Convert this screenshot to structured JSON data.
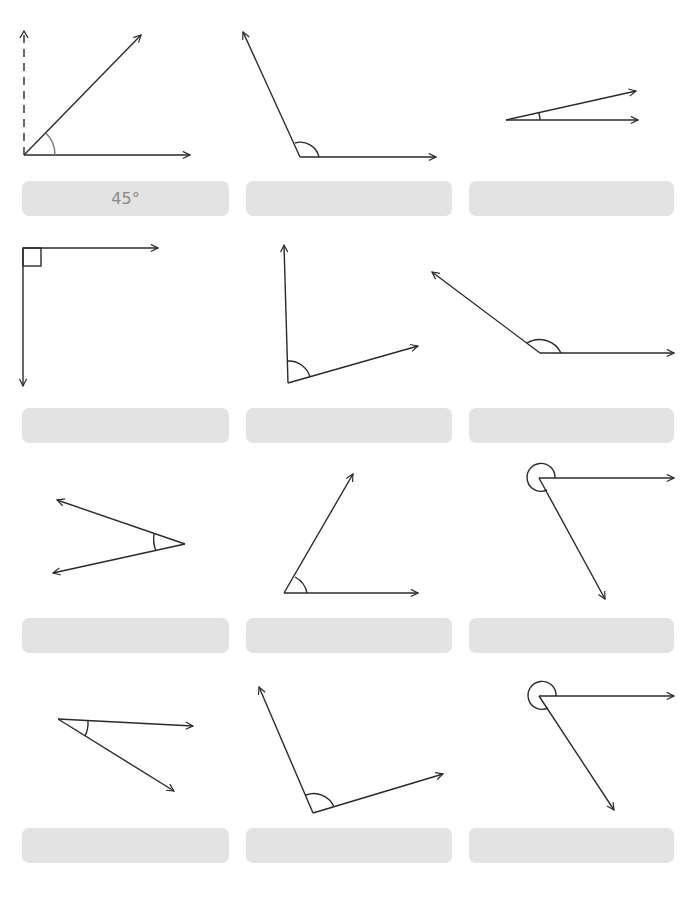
{
  "worksheet": {
    "stroke_color": "#2a2a2a",
    "arc_color": "#555555",
    "answer_box_color": "#e3e3e3",
    "answer_text_color": "#8a8a8a",
    "problems": [
      {
        "id": 1,
        "type": "acute",
        "answer": "45°",
        "reference_line": "dashed-vertical"
      },
      {
        "id": 2,
        "type": "obtuse",
        "answer": ""
      },
      {
        "id": 3,
        "type": "acute",
        "answer": ""
      },
      {
        "id": 4,
        "type": "right",
        "answer": "",
        "marker": "square"
      },
      {
        "id": 5,
        "type": "obtuse",
        "answer": ""
      },
      {
        "id": 6,
        "type": "obtuse",
        "answer": ""
      },
      {
        "id": 7,
        "type": "acute",
        "answer": ""
      },
      {
        "id": 8,
        "type": "acute",
        "answer": ""
      },
      {
        "id": 9,
        "type": "reflex",
        "answer": ""
      },
      {
        "id": 10,
        "type": "acute",
        "answer": ""
      },
      {
        "id": 11,
        "type": "obtuse",
        "answer": ""
      },
      {
        "id": 12,
        "type": "reflex",
        "answer": ""
      }
    ]
  }
}
